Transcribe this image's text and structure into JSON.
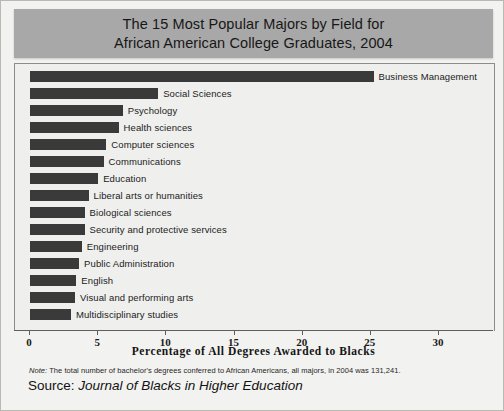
{
  "title": {
    "line1": "The 15 Most Popular Majors by Field for",
    "line2": "African American College Graduates, 2004"
  },
  "axis_title": "Percentage of All Degrees Awarded to Blacks",
  "note": {
    "label": "Note:",
    "text": " The total number of bachelor's degrees conferred to African Americans, all majors, in 2004 was 131,241."
  },
  "source": {
    "label": "Source: ",
    "journal": "Journal of Blacks in Higher Education"
  },
  "chart_data": {
    "type": "bar",
    "orientation": "horizontal",
    "title": "The 15 Most Popular Majors by Field for African American College Graduates, 2004",
    "xlabel": "Percentage of All Degrees Awarded to Blacks",
    "ylabel": "",
    "xlim": [
      0,
      30
    ],
    "xticks": [
      0,
      5,
      10,
      15,
      20,
      25,
      30
    ],
    "grid": false,
    "legend": false,
    "bar_color": "#3a3a3a",
    "categories": [
      "Business Management",
      "Social Sciences",
      "Psychology",
      "Health sciences",
      "Computer sciences",
      "Communications",
      "Education",
      "Liberal arts or humanities",
      "Biological sciences",
      "Security and protective services",
      "Engineering",
      "Public Administration",
      "English",
      "Visual and performing arts",
      "Multidisciplinary studies"
    ],
    "values": [
      25.2,
      9.4,
      6.8,
      6.5,
      5.6,
      5.4,
      5.0,
      4.3,
      4.0,
      4.0,
      3.8,
      3.6,
      3.4,
      3.3,
      3.0
    ]
  }
}
